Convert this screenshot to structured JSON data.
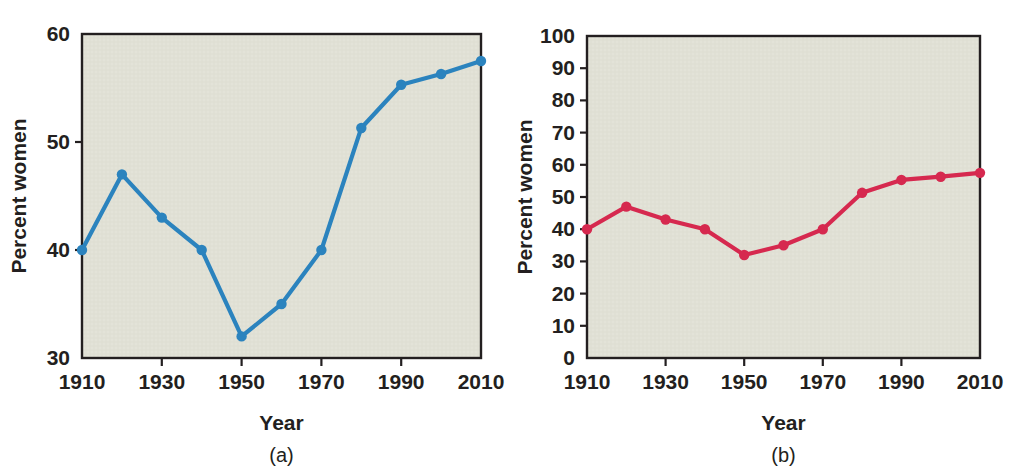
{
  "figure": {
    "panels": [
      {
        "id": "a",
        "caption": "(a)",
        "series_color": "#2b83be",
        "background_color": "#e3e3d8",
        "axis_color": "#231f20"
      },
      {
        "id": "b",
        "caption": "(b)",
        "series_color": "#d6294f",
        "background_color": "#e3e3d8",
        "axis_color": "#231f20"
      }
    ]
  },
  "chart_data": [
    {
      "type": "line",
      "title": "",
      "panel": "(a)",
      "xlabel": "Year",
      "ylabel": "Percent women",
      "x": [
        1910,
        1920,
        1930,
        1940,
        1950,
        1960,
        1970,
        1980,
        1990,
        2000,
        2010
      ],
      "values": [
        40,
        47,
        43,
        40,
        32,
        35,
        40,
        51.3,
        55.3,
        56.3,
        57.5
      ],
      "series": [
        {
          "name": "Percent women",
          "values": [
            40,
            47,
            43,
            40,
            32,
            35,
            40,
            51.3,
            55.3,
            56.3,
            57.5
          ]
        }
      ],
      "xlim": [
        1910,
        2010
      ],
      "ylim": [
        30,
        60
      ],
      "xticks": [
        1910,
        1930,
        1950,
        1970,
        1990,
        2010
      ],
      "xticklabels": [
        "1910",
        "1930",
        "1950",
        "1970",
        "1990",
        "2010"
      ],
      "xminorticks": [
        1920,
        1940,
        1960,
        1980,
        2000
      ],
      "yticks": [
        30,
        40,
        50,
        60
      ],
      "yticklabels": [
        "30",
        "40",
        "50",
        "60"
      ],
      "grid": false,
      "legend": "none",
      "marker": "circle",
      "color": "#2b83be"
    },
    {
      "type": "line",
      "title": "",
      "panel": "(b)",
      "xlabel": "Year",
      "ylabel": "Percent women",
      "x": [
        1910,
        1920,
        1930,
        1940,
        1950,
        1960,
        1970,
        1980,
        1990,
        2000,
        2010
      ],
      "values": [
        40,
        47,
        43,
        40,
        32,
        35,
        40,
        51.3,
        55.3,
        56.3,
        57.5
      ],
      "series": [
        {
          "name": "Percent women",
          "values": [
            40,
            47,
            43,
            40,
            32,
            35,
            40,
            51.3,
            55.3,
            56.3,
            57.5
          ]
        }
      ],
      "xlim": [
        1910,
        2010
      ],
      "ylim": [
        0,
        100
      ],
      "xticks": [
        1910,
        1930,
        1950,
        1970,
        1990,
        2010
      ],
      "xticklabels": [
        "1910",
        "1930",
        "1950",
        "1970",
        "1990",
        "2010"
      ],
      "xminorticks": [
        1920,
        1940,
        1960,
        1980,
        2000
      ],
      "yticks": [
        0,
        10,
        20,
        30,
        40,
        50,
        60,
        70,
        80,
        90,
        100
      ],
      "yticklabels": [
        "0",
        "10",
        "20",
        "30",
        "40",
        "50",
        "60",
        "70",
        "80",
        "90",
        "100"
      ],
      "grid": false,
      "legend": "none",
      "marker": "circle",
      "color": "#d6294f"
    }
  ]
}
